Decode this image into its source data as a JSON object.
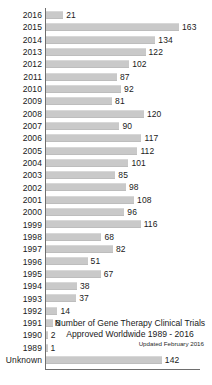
{
  "chart_data": {
    "type": "bar",
    "orientation": "horizontal",
    "title": "Number of Gene Therapy Clinical Trials Approved Worldwide 1989 - 2016",
    "title_line1": "Number of Gene Therapy Clinical Trials",
    "title_line2": "Approved Worldwide 1989 - 2016",
    "subtitle": "Updated February 2016",
    "xlabel": "",
    "ylabel": "",
    "xlim": [
      0,
      163
    ],
    "grid": false,
    "legend": null,
    "bar_color": "#c9c9c9",
    "axis_color": "#6e6e6e",
    "background": "#ffffff",
    "categories": [
      "2016",
      "2015",
      "2014",
      "2013",
      "2012",
      "2011",
      "2010",
      "2009",
      "2008",
      "2007",
      "2006",
      "2005",
      "2004",
      "2003",
      "2002",
      "2001",
      "2000",
      "1999",
      "1998",
      "1997",
      "1996",
      "1995",
      "1994",
      "1993",
      "1992",
      "1991",
      "1990",
      "1989",
      "Unknown"
    ],
    "values": [
      21,
      163,
      134,
      122,
      102,
      87,
      92,
      81,
      120,
      90,
      117,
      112,
      101,
      85,
      98,
      108,
      96,
      116,
      68,
      82,
      51,
      67,
      38,
      37,
      14,
      8,
      2,
      1,
      142
    ]
  }
}
